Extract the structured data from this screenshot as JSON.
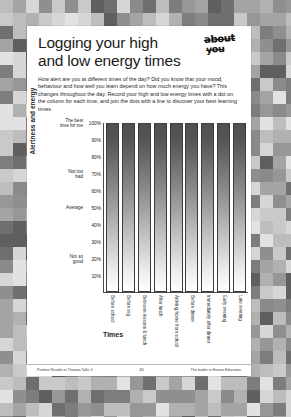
{
  "page": {
    "title_line1": "Logging your high",
    "title_line2": "and low energy times",
    "logo_line1": "about",
    "logo_line2": "you",
    "intro": "How alert are you at different times of the day? Did you know that your mood, behaviour and how well you learn depend on how much energy you have? This changes throughout the day. Record your high and low energy times with a dot on the column for each time, and join the dots with a line to discover your best learning times.",
    "footer_left": "Positive Results at Thomas Tallis 3",
    "footer_mid": "40",
    "footer_right": "The leader in Human Education"
  },
  "chart_data": {
    "type": "bar",
    "title": "",
    "xlabel": "Times",
    "ylabel": "Alertness and energy",
    "ylim": [
      0,
      100
    ],
    "grid": false,
    "legend": "none",
    "categories": [
      "Before school",
      "Before reg",
      "Between lessons & lunch",
      "After lunch",
      "Arriving home from school",
      "Before dinner",
      "Immediately after dinner",
      "Early evening",
      "Late evening"
    ],
    "values": [
      100,
      100,
      100,
      100,
      100,
      100,
      100,
      100,
      100
    ],
    "ytick_values": [
      100,
      90,
      80,
      70,
      60,
      50,
      40,
      30,
      20,
      10
    ],
    "ytick_labels": [
      "100%",
      "90%",
      "80%",
      "70%",
      "60%",
      "50%",
      "40%",
      "30%",
      "20%",
      "10%"
    ],
    "yband_labels": {
      "100": "The best\ntime for me",
      "70": "Not too\nbad",
      "50": "Average",
      "20": "Not so\ngood"
    },
    "bar_fill": "gradient-dark-to-white",
    "bar_border": "#3d3d3d"
  }
}
